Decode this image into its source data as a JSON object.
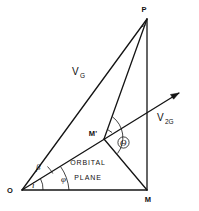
{
  "figure": {
    "kind": "geometric-vector-diagram",
    "background_color": "#ffffff",
    "line_color": "#141414",
    "text_color": "#111111"
  },
  "vertices": {
    "P": "P",
    "M": "M",
    "M_prime": "M'",
    "O": "O"
  },
  "vectors": {
    "vg": {
      "base": "V",
      "subscript": "G"
    },
    "v2g": {
      "base": "V",
      "subscript": "2G"
    }
  },
  "angles": {
    "beta": "β",
    "inclination": "i",
    "phi": "φ",
    "theta": "Θ"
  },
  "plane_label": {
    "line1": "ORBITAL",
    "line2": "PLANE"
  }
}
